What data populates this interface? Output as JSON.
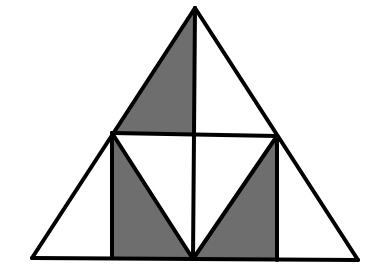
{
  "diagram": {
    "type": "geometric-figure",
    "colors": {
      "background": "#ffffff",
      "stroke": "#000000",
      "shade": "#6e6e6e"
    },
    "stroke_width": 4,
    "points": {
      "apex": [
        195,
        8
      ],
      "left_base": [
        32,
        258
      ],
      "right_base": [
        358,
        260
      ],
      "left_mid": [
        112,
        133
      ],
      "right_mid": [
        277,
        136
      ],
      "center_mid": [
        195,
        134
      ],
      "bottom_center": [
        193,
        259
      ],
      "left_foot": [
        112,
        258
      ],
      "right_foot": [
        277,
        260
      ]
    },
    "shaded_regions": [
      {
        "name": "top-left-shaded-triangle",
        "points": [
          [
            195,
            8
          ],
          [
            112,
            133
          ],
          [
            195,
            134
          ]
        ]
      },
      {
        "name": "bottom-left-shaded-triangle",
        "points": [
          [
            112,
            133
          ],
          [
            112,
            258
          ],
          [
            193,
            259
          ]
        ]
      },
      {
        "name": "bottom-right-shaded-triangle",
        "points": [
          [
            277,
            136
          ],
          [
            277,
            260
          ],
          [
            193,
            259
          ]
        ]
      }
    ],
    "lines": [
      {
        "name": "outer-left-edge",
        "from": [
          195,
          8
        ],
        "to": [
          32,
          258
        ]
      },
      {
        "name": "outer-right-edge",
        "from": [
          195,
          8
        ],
        "to": [
          358,
          260
        ]
      },
      {
        "name": "base-edge",
        "from": [
          32,
          258
        ],
        "to": [
          358,
          260
        ]
      },
      {
        "name": "midline",
        "from": [
          112,
          133
        ],
        "to": [
          277,
          136
        ]
      },
      {
        "name": "center-vertical",
        "from": [
          195,
          8
        ],
        "to": [
          193,
          259
        ]
      },
      {
        "name": "left-vertical",
        "from": [
          112,
          133
        ],
        "to": [
          112,
          258
        ]
      },
      {
        "name": "right-vertical",
        "from": [
          277,
          136
        ],
        "to": [
          277,
          260
        ]
      },
      {
        "name": "left-diagonal",
        "from": [
          112,
          133
        ],
        "to": [
          193,
          259
        ]
      },
      {
        "name": "right-diagonal",
        "from": [
          277,
          136
        ],
        "to": [
          193,
          259
        ]
      }
    ]
  }
}
